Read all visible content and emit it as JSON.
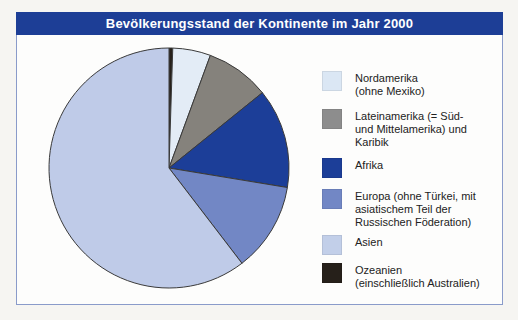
{
  "header": {
    "title": "Bevölkerungsstand der Kontinente im Jahr 2000",
    "bar_color": "#1d3e96",
    "text_color": "#ffffff"
  },
  "frame": {
    "border_color": "#8a9bca"
  },
  "chart_data": {
    "type": "pie",
    "title": "Bevölkerungsstand der Kontinente im Jahr 2000",
    "direction": "clockwise",
    "start_angle": "12-o'clock",
    "legend_position": "right",
    "draw_order": [
      "ozeanien",
      "nordamerika",
      "lateinamerika",
      "afrika",
      "europa",
      "asien"
    ],
    "segments": [
      {
        "id": "nordamerika",
        "label": "Nordamerika (ohne Mexiko)",
        "value_pct": 5.1,
        "color": "#e3ecf6"
      },
      {
        "id": "lateinamerika",
        "label": "Lateinamerika (= Süd- und Mittelamerika) und Karibik",
        "value_pct": 8.6,
        "color": "#85827c"
      },
      {
        "id": "afrika",
        "label": "Afrika",
        "value_pct": 13.4,
        "color": "#1c3e98"
      },
      {
        "id": "europa",
        "label": "Europa (ohne Türkei, mit asiatischem Teil der Russischen Föderation)",
        "value_pct": 12.0,
        "color": "#7287c5"
      },
      {
        "id": "asien",
        "label": "Asien",
        "value_pct": 60.4,
        "color": "#bfcbe8"
      },
      {
        "id": "ozeanien",
        "label": "Ozeanien (einschließlich Australien)",
        "value_pct": 0.5,
        "color": "#26201a"
      }
    ],
    "values_note": "Percent shares estimated from slice angles; the chart prints no numeric labels.",
    "outline_color": "#3a3a3a"
  },
  "legend": {
    "items": [
      {
        "id": "nordamerika",
        "color": "#dbe7f4",
        "label": "Nordamerika\n(ohne Mexiko)"
      },
      {
        "id": "lateinamerika",
        "color": "#8d8d8d",
        "label": "Lateinamerika (= Süd-\nund Mittelamerika) und\nKaribik"
      },
      {
        "id": "afrika",
        "color": "#1c3e98",
        "label": "Afrika"
      },
      {
        "id": "europa",
        "color": "#7287c5",
        "label": "Europa (ohne Türkei, mit\nasiatischem Teil der\nRussischen Föderation)"
      },
      {
        "id": "asien",
        "color": "#c2cfe9",
        "label": "Asien"
      },
      {
        "id": "ozeanien",
        "color": "#26201a",
        "label": "Ozeanien\n(einschließlich Australien)"
      }
    ]
  }
}
